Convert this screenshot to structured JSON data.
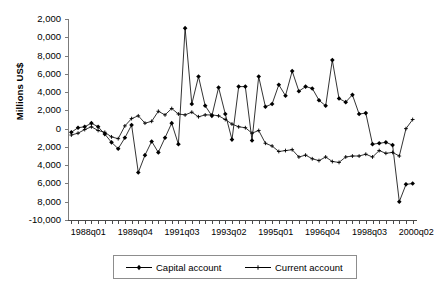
{
  "chart_data": {
    "type": "line",
    "title": "",
    "xlabel": "",
    "ylabel": "Millions US$",
    "ylim": [
      -10000,
      12000
    ],
    "ytick_step": 2000,
    "grid": false,
    "legend_position": "bottom",
    "y_tick_labels": [
      "2,000",
      "0,000",
      "8,000",
      "6,000",
      "4,000",
      "2,000",
      "0",
      "2,000",
      "4,000",
      "6,000",
      "8,000",
      "-10,000"
    ],
    "y_tick_values": [
      12000,
      10000,
      8000,
      6000,
      4000,
      2000,
      0,
      -2000,
      -4000,
      -6000,
      -8000,
      -10000
    ],
    "y_tick_labels_clipped_note": "leading characters of axis labels are cut off at the left image edge",
    "x_tick_labels": [
      "1988q01",
      "1989q04",
      "1991q03",
      "1993q02",
      "1995q01",
      "1996q04",
      "1998q03",
      "2000q02"
    ],
    "x_tick_label_indices": [
      0,
      7,
      14,
      21,
      28,
      35,
      42,
      49
    ],
    "x_tick_count": 52,
    "x": [
      "1988q01",
      "1988q02",
      "1988q03",
      "1988q04",
      "1989q01",
      "1989q02",
      "1989q03",
      "1989q04",
      "1990q01",
      "1990q02",
      "1990q03",
      "1990q04",
      "1991q01",
      "1991q02",
      "1991q03",
      "1991q04",
      "1992q01",
      "1992q02",
      "1992q03",
      "1992q04",
      "1993q01",
      "1993q02",
      "1993q03",
      "1993q04",
      "1994q01",
      "1994q02",
      "1994q03",
      "1994q04",
      "1995q01",
      "1995q02",
      "1995q03",
      "1995q04",
      "1996q01",
      "1996q02",
      "1996q03",
      "1996q04",
      "1997q01",
      "1997q02",
      "1997q03",
      "1997q04",
      "1998q01",
      "1998q02",
      "1998q03",
      "1998q04",
      "1999q01",
      "1999q02",
      "1999q03",
      "1999q04",
      "2000q01",
      "2000q02",
      "2000q03",
      "2000q04"
    ],
    "series": [
      {
        "name": "Capital account",
        "marker": "filled-diamond",
        "color": "#000000",
        "values": [
          -400,
          100,
          200,
          600,
          200,
          -600,
          -1500,
          -2200,
          -1000,
          400,
          -4800,
          -2900,
          -1400,
          -2600,
          -1000,
          600,
          -1700,
          11000,
          2700,
          5700,
          2500,
          1400,
          4500,
          1600,
          -1200,
          4600,
          4600,
          -1300,
          5700,
          2400,
          2700,
          4800,
          3600,
          6300,
          4100,
          4600,
          4400,
          3100,
          2500,
          7500,
          3300,
          2900,
          3700,
          1600,
          1700,
          -1700,
          -1600,
          -1500,
          -1800,
          -8000,
          -6100,
          -6000
        ]
      },
      {
        "name": "Current account",
        "marker": "cross",
        "color": "#000000",
        "values": [
          -700,
          -500,
          -100,
          200,
          -200,
          -400,
          -900,
          -1100,
          300,
          1100,
          1400,
          600,
          800,
          1900,
          1500,
          2200,
          1600,
          1500,
          1800,
          1300,
          1500,
          1500,
          1400,
          1000,
          500,
          200,
          100,
          -500,
          -200,
          -1600,
          -1900,
          -2500,
          -2400,
          -2300,
          -3100,
          -2900,
          -3300,
          -3500,
          -3100,
          -3600,
          -3700,
          -3100,
          -3000,
          -3000,
          -2800,
          -3100,
          -2400,
          -2700,
          -2600,
          -3000,
          0,
          1000
        ]
      }
    ]
  },
  "legend": {
    "items": [
      {
        "label": "Capital account",
        "marker": "filled-diamond"
      },
      {
        "label": "Current account",
        "marker": "cross"
      }
    ]
  }
}
